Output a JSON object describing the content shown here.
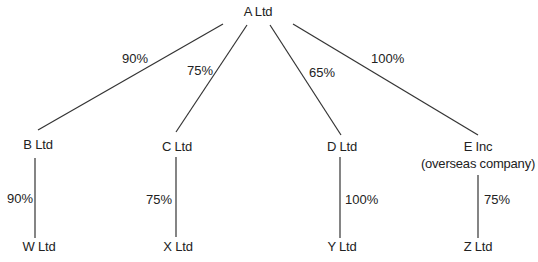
{
  "diagram": {
    "type": "group-structure",
    "parent": {
      "id": "A",
      "label": "A Ltd"
    },
    "subsidiaries": [
      {
        "id": "B",
        "label": "B Ltd",
        "sublabel": "",
        "ownership": "90%",
        "child": {
          "id": "W",
          "label": "W Ltd",
          "ownership": "90%"
        }
      },
      {
        "id": "C",
        "label": "C Ltd",
        "sublabel": "",
        "ownership": "75%",
        "child": {
          "id": "X",
          "label": "X Ltd",
          "ownership": "75%"
        }
      },
      {
        "id": "D",
        "label": "D Ltd",
        "sublabel": "",
        "ownership": "65%",
        "child": {
          "id": "Y",
          "label": "Y Ltd",
          "ownership": "100%"
        }
      },
      {
        "id": "E",
        "label": "E Inc",
        "sublabel": "(overseas company)",
        "ownership": "100%",
        "child": {
          "id": "Z",
          "label": "Z Ltd",
          "ownership": "75%"
        }
      }
    ],
    "line_color": "#333333"
  }
}
